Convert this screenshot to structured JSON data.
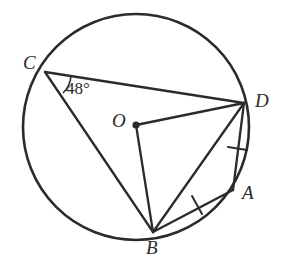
{
  "figure": {
    "stroke_color": "#2b2b2b",
    "background_color": "#ffffff",
    "width": 290,
    "height": 262
  },
  "circle": {
    "center_label": "O",
    "center_x": 136,
    "center_y": 127,
    "radius": 113
  },
  "points": [
    {
      "id": "A",
      "label": "A",
      "x": 233,
      "y": 190,
      "label_x": 242,
      "label_y": 183,
      "on_circle": true
    },
    {
      "id": "B",
      "label": "B",
      "x": 153,
      "y": 232,
      "label_x": 146,
      "label_y": 238,
      "on_circle": true
    },
    {
      "id": "C",
      "label": "C",
      "x": 45,
      "y": 72,
      "label_x": 23,
      "label_y": 53,
      "on_circle": true
    },
    {
      "id": "D",
      "label": "D",
      "x": 244,
      "y": 103,
      "label_x": 255,
      "label_y": 91,
      "on_circle": true
    },
    {
      "id": "O",
      "label": "O",
      "x": 136,
      "y": 125,
      "label_x": 112,
      "label_y": 111,
      "on_circle": false
    }
  ],
  "segments": [
    {
      "id": "CD",
      "from": "C",
      "to": "D",
      "tick_marks": 0
    },
    {
      "id": "CB",
      "from": "C",
      "to": "B",
      "tick_marks": 0
    },
    {
      "id": "OD",
      "from": "O",
      "to": "D",
      "tick_marks": 0
    },
    {
      "id": "OB",
      "from": "O",
      "to": "B",
      "tick_marks": 0
    },
    {
      "id": "BD",
      "from": "B",
      "to": "D",
      "tick_marks": 0
    },
    {
      "id": "DA",
      "from": "D",
      "to": "A",
      "tick_marks": 1
    },
    {
      "id": "BA",
      "from": "B",
      "to": "A",
      "tick_marks": 1
    }
  ],
  "angle": {
    "label": "48°",
    "value": 48,
    "unit": "degrees",
    "vertex": "C",
    "rays": [
      "B",
      "D"
    ],
    "label_x": 66,
    "label_y": 80
  },
  "tick_marks": [
    {
      "id": "tick-DA",
      "segment": "DA",
      "x": 237,
      "y": 148
    },
    {
      "id": "tick-BA",
      "segment": "BA",
      "x": 197,
      "y": 205
    }
  ]
}
